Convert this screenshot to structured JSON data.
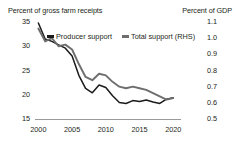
{
  "header": {
    "left_axis_title": "Percent of gross farm receipts",
    "right_axis_title": "Percent of GDP"
  },
  "legend": [
    {
      "label": "Producer support",
      "color": "#1a1a1a"
    },
    {
      "label": "Total support (RHS)",
      "color": "#6e6e6e"
    }
  ],
  "chart_data": {
    "type": "line",
    "title": "",
    "xlabel": "",
    "ylabel": "Percent of gross farm receipts",
    "y2label": "Percent of GDP",
    "xlim": [
      1999.5,
      2021
    ],
    "ylim": [
      15,
      35
    ],
    "y2lim": [
      0.5,
      1.1
    ],
    "yticks": [
      15,
      20,
      25,
      30,
      35
    ],
    "y2ticks": [
      0.5,
      0.6,
      0.7,
      0.8,
      0.9,
      1.0,
      1.1
    ],
    "xticks": [
      2000,
      2005,
      2010,
      2015,
      2020
    ],
    "grid": false,
    "legend_position": "top-left",
    "x": [
      2000,
      2001,
      2002,
      2003,
      2004,
      2005,
      2006,
      2007,
      2008,
      2009,
      2010,
      2011,
      2012,
      2013,
      2014,
      2015,
      2016,
      2017,
      2018,
      2019,
      2020
    ],
    "series": [
      {
        "name": "Producer support",
        "axis": "left",
        "color": "#1a1a1a",
        "values": [
          34.8,
          31.5,
          31.0,
          30.3,
          29.6,
          28.0,
          24.0,
          21.3,
          20.4,
          22.0,
          21.5,
          19.8,
          18.4,
          18.2,
          18.8,
          18.6,
          18.9,
          18.5,
          18.2,
          19.1,
          19.4
        ]
      },
      {
        "name": "Total support (RHS)",
        "axis": "right",
        "color": "#6e6e6e",
        "values": [
          1.06,
          0.98,
          1.0,
          0.95,
          0.96,
          0.93,
          0.84,
          0.76,
          0.74,
          0.78,
          0.77,
          0.73,
          0.7,
          0.69,
          0.7,
          0.69,
          0.68,
          0.66,
          0.64,
          0.62,
          0.63
        ]
      }
    ]
  },
  "axis_labels": {
    "left": [
      "35",
      "30",
      "25",
      "20",
      "15"
    ],
    "right": [
      "1.1",
      "1.0",
      "0.9",
      "0.8",
      "0.7",
      "0.6",
      "0.5"
    ],
    "x": [
      "2000",
      "2005",
      "2010",
      "2015",
      "2020"
    ]
  }
}
